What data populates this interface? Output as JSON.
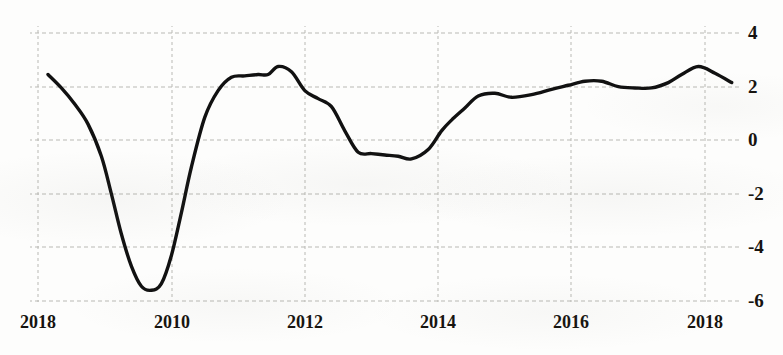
{
  "chart_data": {
    "type": "line",
    "title": "",
    "subtitle": "",
    "xlabel": "",
    "ylabel": "",
    "grid": true,
    "legend": null,
    "legend_position": "none",
    "xlim": [
      2018,
      2018.6
    ],
    "ylim": [
      -6,
      4
    ],
    "x_tick_labels": [
      "2018",
      "2010",
      "2012",
      "2014",
      "2016",
      "2018"
    ],
    "y_tick_labels": [
      "4",
      "2",
      "0",
      "-2",
      "-4",
      "-6"
    ],
    "y_ticks": [
      4,
      2,
      0,
      -2,
      -4,
      -6
    ],
    "series": [
      {
        "name": "",
        "color": "#111111",
        "x": [
          2008.15,
          2008.35,
          2008.55,
          2008.75,
          2008.95,
          2009.1,
          2009.25,
          2009.4,
          2009.55,
          2009.7,
          2009.85,
          2010.0,
          2010.15,
          2010.3,
          2010.5,
          2010.7,
          2010.9,
          2011.1,
          2011.3,
          2011.45,
          2011.6,
          2011.8,
          2012.0,
          2012.2,
          2012.4,
          2012.6,
          2012.8,
          2013.0,
          2013.2,
          2013.4,
          2013.6,
          2013.85,
          2014.05,
          2014.2,
          2014.4,
          2014.6,
          2014.85,
          2015.1,
          2015.4,
          2015.7,
          2015.95,
          2016.2,
          2016.45,
          2016.7,
          2016.95,
          2017.2,
          2017.45,
          2017.65,
          2017.9,
          2018.15,
          2018.4
        ],
        "y": [
          2.45,
          1.95,
          1.35,
          0.6,
          -0.6,
          -2.0,
          -3.5,
          -4.7,
          -5.45,
          -5.6,
          -5.35,
          -4.3,
          -2.7,
          -1.0,
          0.85,
          1.85,
          2.35,
          2.4,
          2.45,
          2.45,
          2.75,
          2.55,
          1.85,
          1.55,
          1.25,
          0.35,
          -0.45,
          -0.5,
          -0.55,
          -0.6,
          -0.7,
          -0.35,
          0.35,
          0.75,
          1.2,
          1.65,
          1.75,
          1.6,
          1.7,
          1.9,
          2.05,
          2.2,
          2.2,
          2.0,
          1.95,
          1.95,
          2.15,
          2.45,
          2.75,
          2.5,
          2.15
        ]
      }
    ]
  },
  "axes": {
    "x_ticks": [
      {
        "label": "2018",
        "px": 38
      },
      {
        "label": "2010",
        "px": 172
      },
      {
        "label": "2012",
        "px": 305
      },
      {
        "label": "2014",
        "px": 438
      },
      {
        "label": "2016",
        "px": 571
      },
      {
        "label": "2018",
        "px": 705
      }
    ],
    "y_ticks": [
      {
        "label": "4",
        "px": 33
      },
      {
        "label": "2",
        "px": 87
      },
      {
        "label": "0",
        "px": 140
      },
      {
        "label": "-2",
        "px": 194
      },
      {
        "label": "-4",
        "px": 247
      },
      {
        "label": "-6",
        "px": 301
      }
    ]
  }
}
